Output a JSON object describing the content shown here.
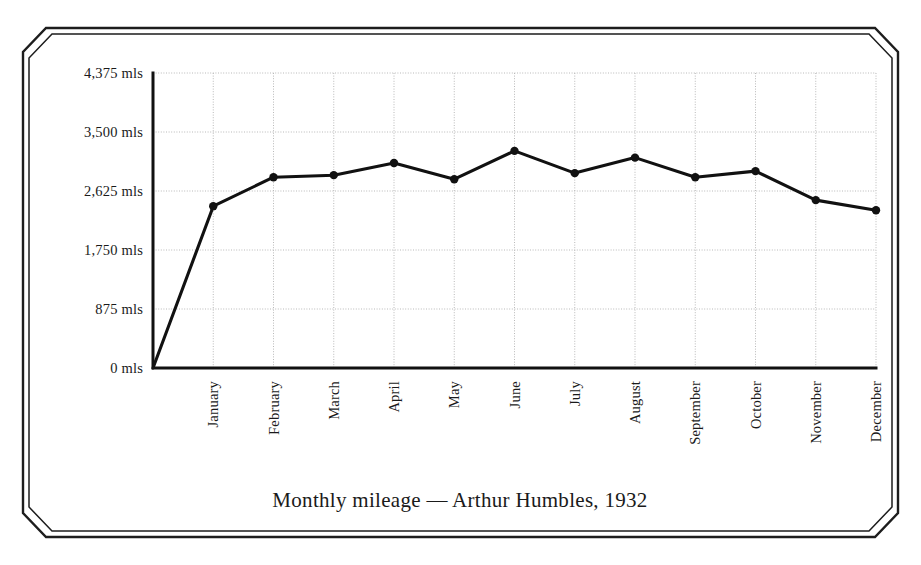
{
  "chart_data": {
    "type": "line",
    "title": "Monthly mileage — Arthur Humbles, 1932",
    "xlabel": "",
    "ylabel": "",
    "categories": [
      "January",
      "February",
      "March",
      "April",
      "May",
      "June",
      "July",
      "August",
      "September",
      "October",
      "November",
      "December"
    ],
    "values": [
      2400,
      2830,
      2860,
      3040,
      2800,
      3220,
      2890,
      3120,
      2830,
      2920,
      2490,
      2340
    ],
    "series": [
      {
        "name": "Monthly mileage",
        "values": [
          2400,
          2830,
          2860,
          3040,
          2800,
          3220,
          2890,
          3120,
          2830,
          2920,
          2490,
          2340
        ]
      }
    ],
    "ytick_labels": [
      "0 mls",
      "875 mls",
      "1,750 mls",
      "2,625 mls",
      "3,500 mls",
      "4,375 mls"
    ],
    "ytick_values": [
      0,
      875,
      1750,
      2625,
      3500,
      4375
    ],
    "ylim": [
      0,
      4375
    ],
    "unit": "mls",
    "grid": true,
    "legend": "none",
    "marker": "filled-circle",
    "line_color": "#111111",
    "grid_color": "#b9b9b9",
    "axis_color": "#111111",
    "background_color": "#ffffff",
    "origin_starts_at_zero": true
  },
  "frame": {
    "style": "double-line-octagonal-border",
    "color": "#1d1d1d"
  }
}
